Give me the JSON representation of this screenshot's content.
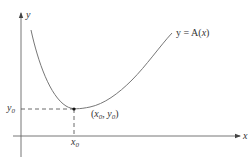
{
  "diagram": {
    "type": "function-graph",
    "colors": {
      "axis": "#555555",
      "curve": "#777777",
      "dash": "#444444",
      "text": "#333333",
      "point": "#111111"
    },
    "axes": {
      "x_label": "x",
      "y_label": "y"
    },
    "curve": {
      "label_prefix": "y = A(",
      "label_var": "x",
      "label_suffix": ")",
      "label_full": "y = A(x)"
    },
    "minimum_point": {
      "label": "(x0, y0)",
      "x_label_base": "x",
      "x_label_sub": "0",
      "y_label_base": "y",
      "y_label_sub": "0"
    },
    "x_tick": {
      "base": "x",
      "sub": "0"
    },
    "y_tick": {
      "base": "y",
      "sub": "0"
    }
  }
}
